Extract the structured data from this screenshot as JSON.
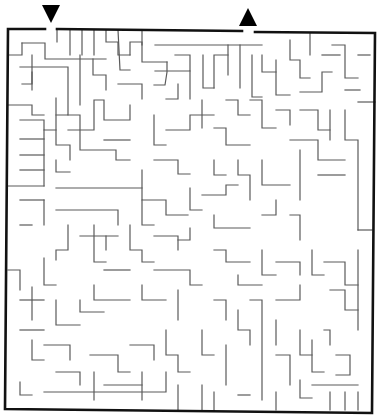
{
  "puzzle": {
    "type": "maze",
    "colors": {
      "background": "#ffffff",
      "walls": "#5a5a5a",
      "border": "#111111",
      "arrows": "#000000"
    },
    "entrance": {
      "icon": "down-arrow-icon",
      "points": "42,5 60,5 51,23",
      "gap": [
        45,
        57
      ]
    },
    "exit": {
      "icon": "up-arrow-icon",
      "points": "239,26 257,26 248,8",
      "gap": [
        242,
        255
      ]
    },
    "border": [
      "45,29 8,29 5,409 372,413 375,33 255,32",
      "242,31 57,29"
    ],
    "walls": [
      "57,29 57,42",
      "70,30 70,55",
      "82,30 82,55",
      "94,30 94,55",
      "106,30 106,42 118,42 118,55 130,55",
      "22,43 22,55 8,55",
      "22,43 45,43 45,59 106,59",
      "32,72 32,84 22,84",
      "20,67 68,67 68,115 56,115",
      "32,55 32,90",
      "80,55 80,105",
      "93,59 93,75 106,75 106,90",
      "118,30 120,70 130,70",
      "118,84 142,84 142,99",
      "130,55 130,42 142,42 142,62 167,62",
      "155,45 262,45",
      "142,45 142,30",
      "167,62 167,72 165,85 154,85",
      "175,55 190,55 190,71 155,71",
      "190,71 190,99",
      "178,84 178,99 166,99",
      "203,55 203,88 214,88",
      "214,88 214,55 228,55",
      "228,45 228,75",
      "240,45 240,88",
      "252,55 252,97 262,97",
      "262,55 262,72 276,72",
      "276,60 276,95 290,95",
      "290,40 290,60 300,60 300,78 310,78",
      "300,92 322,92 322,72 332,72",
      "322,55 340,55",
      "310,33 310,55",
      "332,45 345,45 345,78 358,78",
      "345,90 360,90",
      "358,55 370,55",
      "358,102 375,102",
      "8,105 32,105 32,115 44,115",
      "20,120 44,120 44,130 56,130",
      "20,139 44,139",
      "20,155 44,155",
      "20,170 44,170",
      "8,186 44,186",
      "44,130 44,186",
      "56,98 56,145 70,145 70,160",
      "68,115 80,115 80,150 116,150 116,160 130,160",
      "68,130 94,130 94,100 104,100 104,120 130,120 130,105",
      "104,140 130,140",
      "56,160 56,172 70,172",
      "20,200 44,200",
      "44,200 44,225",
      "20,225 32,225",
      "56,188 142,188",
      "142,170 142,200 166,200 166,215 188,215",
      "154,160 178,160 178,174 190,174",
      "166,130 190,130 190,115 214,115",
      "154,115 154,145 166,145",
      "202,100 202,128",
      "214,128 226,128 226,145 250,145",
      "226,100 238,100 238,115 250,115",
      "250,100 262,100 262,128 276,128",
      "276,110 290,110 290,125",
      "300,110 318,110 318,130 330,130",
      "290,140 318,140 318,160 345,160",
      "318,175 345,175",
      "300,150 300,200",
      "330,140 330,110",
      "345,110 345,140 358,140 358,230",
      "358,230 372,230",
      "56,210 118,210 118,225",
      "68,225 68,250 56,250 56,260",
      "80,236 118,236",
      "94,225 94,262 106,262",
      "106,236 106,250",
      "130,225 130,250 142,250 142,262 154,262",
      "154,236 178,236 178,250",
      "142,200 142,225 154,225",
      "190,188 190,210 202,210",
      "202,195 226,195 226,185 238,185",
      "238,160 238,175 250,175 250,200",
      "214,160 214,175 226,175",
      "262,160 262,185 290,185",
      "276,200 276,215 262,215",
      "214,215 214,228 250,228",
      "290,215 300,215 300,240",
      "190,228 190,240 178,240",
      "8,270 20,270 20,290",
      "20,300 44,300",
      "32,287 32,320",
      "44,258 44,285 56,285",
      "56,300 56,325 80,325",
      "80,300 80,312 104,312",
      "94,285 94,300 130,300",
      "142,285 142,300 166,300",
      "104,270 130,270",
      "154,270 190,270 190,285 202,285",
      "178,290 178,320",
      "214,250 226,250 226,262 250,262",
      "238,275 238,285 262,285",
      "262,250 262,275 276,275",
      "276,262 300,262 300,275",
      "300,285 300,300 276,300",
      "312,250 312,275 324,275",
      "324,262 345,262 345,285 358,285",
      "330,290 345,290 345,310 358,310",
      "358,250 358,330",
      "20,330 44,330",
      "32,340 32,360 44,360",
      "44,345 70,345 70,360",
      "56,372 80,372 80,385",
      "90,355 118,355 118,372 130,372",
      "94,372 94,400",
      "104,385 142,385",
      "130,345 154,345 154,360",
      "166,330 166,355 178,355 178,372 190,372",
      "142,372 142,400",
      "202,330 202,355 214,355",
      "214,300 226,300 226,320",
      "238,310 238,330 250,330 250,345",
      "226,345 226,385",
      "250,300 262,300 262,400",
      "276,320 276,345",
      "276,355 290,355 290,385",
      "300,330 300,355 312,355",
      "312,340 312,372 324,372",
      "324,330 330,330 330,345",
      "336,355 350,355 350,375 336,375",
      "312,385 358,385",
      "330,392 330,410",
      "345,392 345,410",
      "358,392 358,410",
      "20,382 20,395 32,395",
      "44,392 166,392 166,372",
      "178,385 178,410",
      "202,385 202,410",
      "214,392 214,410",
      "238,395 250,395",
      "276,392 276,410",
      "300,380 300,398 312,398"
    ]
  }
}
